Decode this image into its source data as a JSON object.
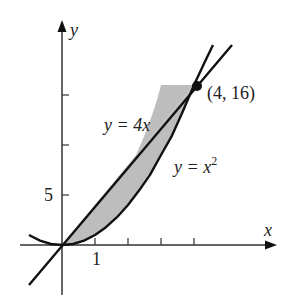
{
  "figure": {
    "axes": {
      "x_label": "x",
      "y_label": "y",
      "x_tick_label": "1",
      "y_tick_label": "5",
      "x_ticks": [
        1,
        2,
        3,
        4
      ],
      "y_ticks": [
        5,
        10,
        15
      ]
    },
    "curves": [
      {
        "name": "line",
        "label_prefix": "y = 4",
        "label_var": "x",
        "equation": "y = 4x"
      },
      {
        "name": "parabola",
        "label_prefix": "y = ",
        "label_var": "x",
        "label_exp": "2",
        "equation": "y = x^2"
      }
    ],
    "intersection_point": {
      "label": "(4, 16)",
      "x": 4,
      "y": 16
    },
    "shaded_region": "area between y = 4x and y = x^2 for 0 ≤ x ≤ 4",
    "colors": {
      "stroke": "#111111",
      "fill": "#bdbdbd",
      "text": "#222222"
    }
  }
}
